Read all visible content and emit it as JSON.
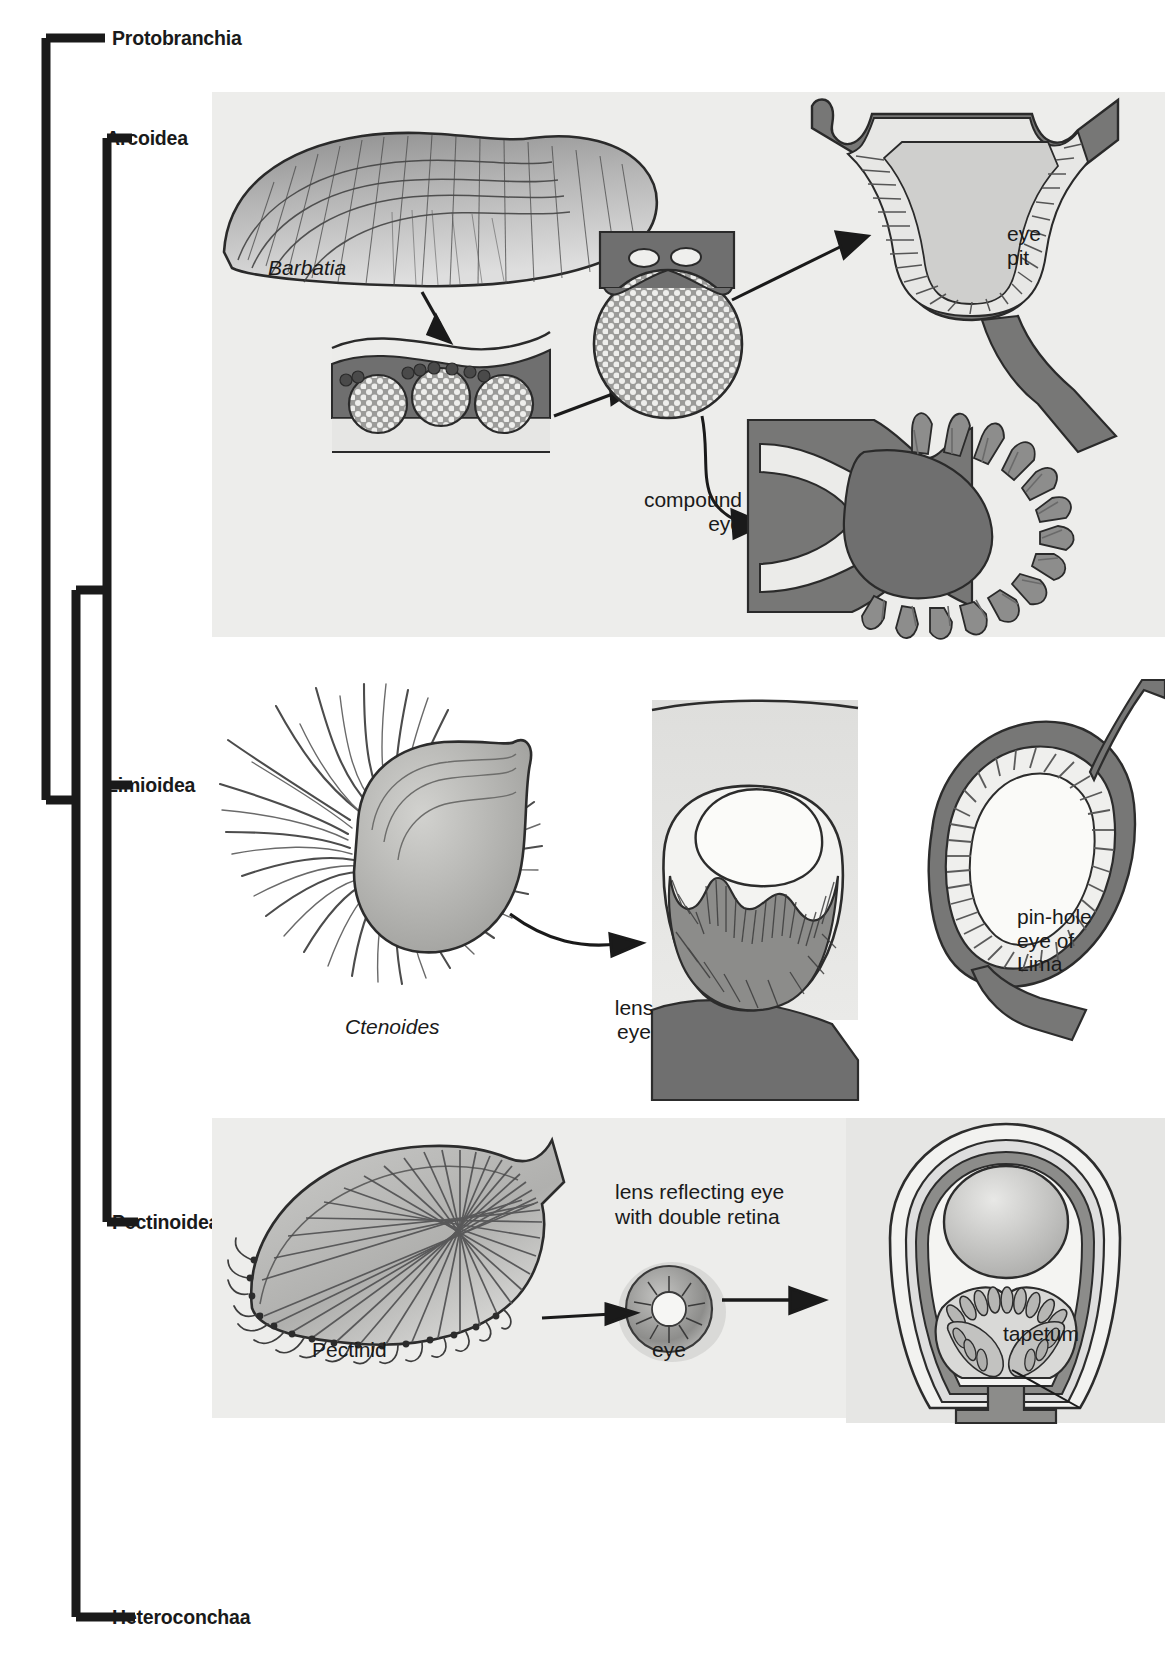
{
  "figure": {
    "type": "cladogram-with-anatomy-illustrations",
    "background_color": "#ffffff",
    "panel_background_color": "#ededeb",
    "ink_color": "#1a1a1a",
    "shell_fill": "#9a9a9a",
    "tissue_dark": "#6e6e6e",
    "tissue_light": "#d6d6d4"
  },
  "cladogram": {
    "taxa": [
      {
        "id": "protobranchia",
        "label": "Protobranchia",
        "tip_y": 38
      },
      {
        "id": "arcoidea",
        "label": "Arcoidea",
        "tip_y": 138
      },
      {
        "id": "limioidea",
        "label": "Limioidea",
        "tip_y": 785
      },
      {
        "id": "pectinoidea",
        "label": "Pectinoidea",
        "tip_y": 1222
      },
      {
        "id": "heteroconchaa",
        "label": "Heteroconchaa",
        "tip_y": 1617
      }
    ],
    "nodes": [
      {
        "id": "root",
        "x": 42,
        "children": [
          "protobranchia",
          "nodeA"
        ]
      },
      {
        "id": "nodeA",
        "x": 72,
        "children": [
          "nodeB",
          "heteroconchaa"
        ]
      },
      {
        "id": "nodeB",
        "x": 103,
        "children": [
          "arcoidea_clade"
        ]
      },
      {
        "id": "arcoidea_clade",
        "x": 103,
        "children": [
          "arcoidea",
          "limioidea",
          "pectinoidea"
        ]
      }
    ],
    "tip_label_x": 112
  },
  "panels": [
    {
      "id": "arcoidea-panel",
      "taxon": "Arcoidea",
      "background": {
        "x": 212,
        "y": 92,
        "width": 953,
        "height": 545
      },
      "items": [
        {
          "id": "barbatia-shell",
          "name": "ark-clam-shell-illustration",
          "label": "Barbatia",
          "italic": true,
          "label_x": 268,
          "label_y": 265
        },
        {
          "id": "mantle-section",
          "name": "mantle-cross-section-with-eyes",
          "label": "",
          "italic": false
        },
        {
          "id": "compound-eye-ball",
          "name": "compound-eye-surface-illustration",
          "label": "",
          "italic": false
        },
        {
          "id": "eye-pit-section",
          "name": "eye-pit-cross-section",
          "label": "eye\npit",
          "italic": false,
          "label_x": 1007,
          "label_y": 230
        },
        {
          "id": "compound-eye-section",
          "name": "compound-eye-cross-section",
          "label": "compound\neye",
          "italic": false,
          "label_x": 632,
          "label_y": 495
        }
      ],
      "arrows": [
        {
          "from": "barbatia-shell",
          "to": "mantle-section"
        },
        {
          "from": "mantle-section",
          "to": "compound-eye-ball"
        },
        {
          "from": "compound-eye-ball",
          "to": "eye-pit-section"
        },
        {
          "from": "compound-eye-ball",
          "to": "compound-eye-section"
        }
      ]
    },
    {
      "id": "limioidea-panel",
      "taxon": "Limioidea",
      "background": null,
      "items": [
        {
          "id": "ctenoides-shell",
          "name": "file-clam-illustration",
          "label": "Ctenoides",
          "italic": true,
          "label_x": 345,
          "label_y": 1025
        },
        {
          "id": "lens-eye-section",
          "name": "lens-eye-cross-section",
          "label": "lens\neye",
          "italic": false,
          "label_x": 594,
          "label_y": 1005
        },
        {
          "id": "pinhole-eye-section",
          "name": "pinhole-eye-cross-section",
          "label": "pin-hole\neye of\nLima",
          "italic": false,
          "label_x": 1017,
          "label_y": 915,
          "italic_last_line": true
        }
      ],
      "arrows": [
        {
          "from": "ctenoides-shell",
          "to": "lens-eye-section"
        }
      ]
    },
    {
      "id": "pectinoidea-panel",
      "taxon": "Pectinoidea",
      "background": {
        "x": 212,
        "y": 1118,
        "width": 953,
        "height": 300
      },
      "items": [
        {
          "id": "pectinid-shell",
          "name": "scallop-shell-illustration",
          "label": "Pectinid",
          "italic": false,
          "label_x": 312,
          "label_y": 1348
        },
        {
          "id": "scallop-eye",
          "name": "scallop-eye-illustration",
          "label": "eye",
          "italic": false,
          "label_x": 652,
          "label_y": 1348
        },
        {
          "id": "scallop-eye-section",
          "name": "scallop-eye-cross-section",
          "label": "lens reflecting eye\nwith double retina",
          "italic": false,
          "label_x": 615,
          "label_y": 1190
        },
        {
          "id": "tapetum-label",
          "name": "tapetum-callout",
          "label": "tapetum",
          "italic": false,
          "label_x": 1003,
          "label_y": 1332
        }
      ],
      "arrows": [
        {
          "from": "pectinid-shell",
          "to": "scallop-eye"
        },
        {
          "from": "scallop-eye",
          "to": "scallop-eye-section"
        }
      ],
      "leaders": [
        {
          "from": "tapetum-label",
          "to": "scallop-eye-section"
        }
      ]
    }
  ]
}
